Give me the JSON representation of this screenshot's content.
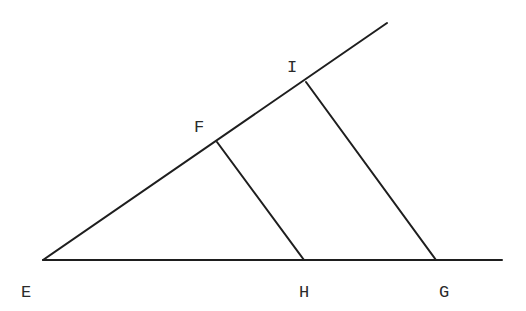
{
  "diagram": {
    "type": "geometry",
    "points": {
      "E": {
        "label": "E",
        "x": 43,
        "y": 260,
        "label_x": 21,
        "label_y": 297
      },
      "F": {
        "label": "F",
        "x": 217,
        "y": 142,
        "label_x": 194,
        "label_y": 132
      },
      "I": {
        "label": "I",
        "x": 306,
        "y": 82,
        "label_x": 287,
        "label_y": 72
      },
      "H": {
        "label": "H",
        "x": 304,
        "y": 260,
        "label_x": 299,
        "label_y": 297
      },
      "G": {
        "label": "G",
        "x": 436,
        "y": 260,
        "label_x": 439,
        "label_y": 297
      }
    },
    "segments": [
      {
        "name": "ray-upper",
        "from": "E",
        "x1": 43,
        "y1": 260,
        "x2": 387,
        "y2": 23
      },
      {
        "name": "ray-base",
        "from": "E",
        "x1": 43,
        "y1": 260,
        "x2": 502,
        "y2": 260
      },
      {
        "name": "segment-FH",
        "x1": 217,
        "y1": 142,
        "x2": 304,
        "y2": 260
      },
      {
        "name": "segment-IG",
        "x1": 306,
        "y1": 82,
        "x2": 436,
        "y2": 260
      }
    ],
    "line_color": "#1e1e1e",
    "label_color": "#2a2a2a"
  }
}
